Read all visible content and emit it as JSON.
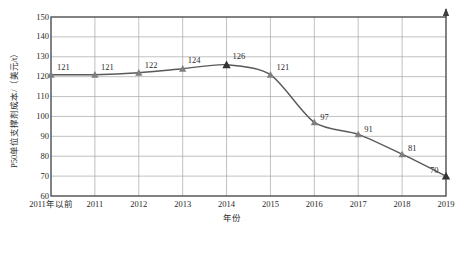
{
  "chart_data": {
    "type": "line",
    "title": "",
    "xlabel": "年份",
    "ylabel": "P50单位支撑剂成本/（美元/t）",
    "categories": [
      "2011年以前",
      "2011",
      "2012",
      "2013",
      "2014",
      "2015",
      "2016",
      "2017",
      "2018",
      "2019"
    ],
    "values": [
      121,
      121,
      122,
      124,
      126,
      121,
      97,
      91,
      81,
      70
    ],
    "point_labels": [
      "121",
      "121",
      "122",
      "124",
      "126",
      "121",
      "97",
      "91",
      "81",
      "70"
    ],
    "ylim": [
      60,
      150
    ],
    "yticks": [
      "150",
      "140",
      "130",
      "120",
      "110",
      "100",
      "90",
      "80",
      "70",
      "60"
    ],
    "ytick_values": [
      150,
      140,
      130,
      120,
      110,
      100,
      90,
      80,
      70,
      60
    ],
    "grid": true,
    "legend": "none",
    "series_name": "P50单位支撑剂成本",
    "colors": {
      "line": "#595959",
      "marker": "#7f7f7f",
      "marker_highlight": "#333333",
      "grid": "#a6a6a6",
      "axis": "#404040",
      "text": "#2b2b2b",
      "background": "#ffffff"
    },
    "highlight_indices": [
      4,
      9
    ]
  }
}
